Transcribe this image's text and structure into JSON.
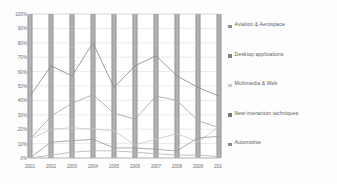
{
  "chart_data": {
    "type": "line",
    "title": "",
    "xlabel": "",
    "ylabel": "",
    "grid": true,
    "legend_position": "right",
    "ylim": [
      0,
      100
    ],
    "ytick_labels": [
      "0%",
      "10%",
      "20%",
      "30%",
      "40%",
      "50%",
      "60%",
      "70%",
      "80%",
      "90%",
      "100%"
    ],
    "ytick_values": [
      0,
      10,
      20,
      30,
      40,
      50,
      60,
      70,
      80,
      90,
      100
    ],
    "categories": [
      "2001",
      "2002",
      "2003",
      "2004",
      "2005",
      "2006",
      "2007",
      "2008",
      "2009",
      "2010"
    ],
    "series": [
      {
        "name": "Aviation & Aerospace",
        "color": "#8d8d8f",
        "values": [
          43,
          64,
          57,
          80,
          49,
          64,
          71,
          57,
          49,
          43
        ]
      },
      {
        "name": "Desktop applications",
        "color": "#a8a8aa",
        "values": [
          13,
          29,
          38,
          44,
          31,
          27,
          43,
          40,
          26,
          21
        ]
      },
      {
        "name": "Multimedia & Web",
        "color": "#c6c6c8",
        "values": [
          13,
          20,
          21,
          20,
          19,
          9,
          13,
          17,
          11,
          22
        ]
      },
      {
        "name": "New interaction techniques",
        "color": "#9b9b9d",
        "values": [
          0,
          11,
          12,
          13,
          7,
          7,
          6,
          5,
          14,
          15
        ]
      },
      {
        "name": "Automotive",
        "color": "#b5b5b7",
        "values": [
          0,
          2,
          4,
          5,
          5,
          4,
          3,
          2,
          2,
          1
        ]
      }
    ],
    "bars": {
      "name": "year-gridline-bars",
      "color": "#9d9d9f",
      "value": 100
    }
  },
  "legend": {
    "items": [
      {
        "label": "Aviation & Aerospace",
        "color": "#8d8d8f"
      },
      {
        "label": "Desktop applications",
        "color": "#7f7f81"
      },
      {
        "label": "Multimedia & Web",
        "color": "#c9c9cb"
      },
      {
        "label": "New interaction techniques",
        "color": "#79797b"
      },
      {
        "label": "Automotive",
        "color": "#8a8a8c"
      }
    ]
  },
  "axis": {
    "x_labels": [
      "2001",
      "2002",
      "2003",
      "2004",
      "2005",
      "2006",
      "2007",
      "2008",
      "2009",
      "2010"
    ],
    "y_labels": [
      "100%",
      "90%",
      "80%",
      "70%",
      "60%",
      "50%",
      "40%",
      "30%",
      "20%",
      "10%",
      "0%"
    ]
  }
}
